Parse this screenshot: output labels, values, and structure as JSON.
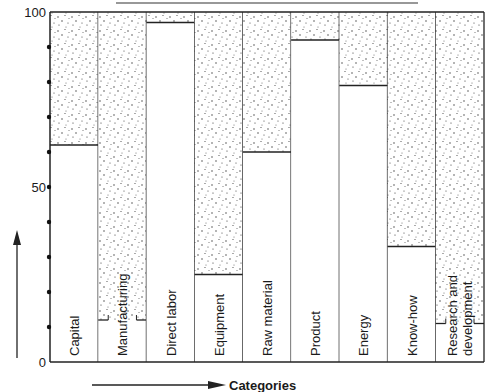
{
  "chart_data": {
    "type": "bar",
    "subtype": "stacked-100-percent",
    "title": "",
    "xlabel": "Categories",
    "ylabel": "",
    "ylim": [
      0,
      100
    ],
    "yticks": [
      0,
      50,
      100
    ],
    "yminor_dots": [
      10,
      20,
      30,
      40,
      50,
      60,
      70,
      80,
      90
    ],
    "grid": false,
    "legend": "none",
    "categories": [
      "Capital",
      "Manufacturing",
      "Direct labor",
      "Equipment",
      "Raw material",
      "Product",
      "Energy",
      "Know-how",
      "Research and development"
    ],
    "category_lines": [
      [
        "Capital"
      ],
      [
        "Manufacturing"
      ],
      [
        "Direct labor"
      ],
      [
        "Equipment"
      ],
      [
        "Raw material"
      ],
      [
        "Product"
      ],
      [
        "Energy"
      ],
      [
        "Know-how"
      ],
      [
        "Research and",
        "development"
      ]
    ],
    "series": [
      {
        "name": "lower (white)",
        "pattern": "none",
        "values": [
          62,
          12,
          97,
          25,
          60,
          92,
          79,
          33,
          11
        ]
      },
      {
        "name": "upper (stippled)",
        "pattern": "stipple",
        "values": [
          38,
          88,
          3,
          75,
          40,
          8,
          21,
          67,
          89
        ]
      }
    ],
    "notched_boundaries": [
      1,
      8
    ]
  }
}
